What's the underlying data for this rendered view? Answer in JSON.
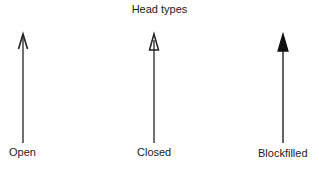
{
  "diagram": {
    "title": "Head types",
    "arrows": [
      {
        "label": "Open",
        "head": "open"
      },
      {
        "label": "Closed",
        "head": "closed"
      },
      {
        "label": "Blockfilled",
        "head": "filled"
      }
    ],
    "stroke_color": "#222222"
  }
}
